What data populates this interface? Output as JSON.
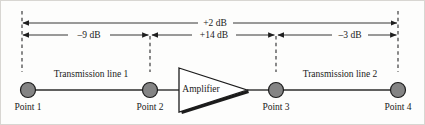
{
  "diagram": {
    "type": "signal-chain-block-diagram",
    "colors": {
      "node_fill": "#848484",
      "stroke": "#1c1c1c",
      "background": "#fdfdfc",
      "frame": "#d8d6d2"
    },
    "overall": {
      "label": "+2 dB",
      "from": "Point 1",
      "to": "Point 4",
      "value_db": 2
    },
    "segments": [
      {
        "id": "seg-1",
        "label": "–9 dB",
        "value_db": -9,
        "from": "Point 1",
        "to": "Point 2",
        "element": "Transmission line 1"
      },
      {
        "id": "seg-2",
        "label": "+14 dB",
        "value_db": 14,
        "from": "Point 2",
        "to": "Point 3",
        "element": "Amplifier"
      },
      {
        "id": "seg-3",
        "label": "–3 dB",
        "value_db": -3,
        "from": "Point 3",
        "to": "Point 4",
        "element": "Transmission line 2"
      }
    ],
    "nodes": [
      {
        "id": "point-1",
        "label": "Point 1",
        "x": 28,
        "y": 90
      },
      {
        "id": "point-2",
        "label": "Point 2",
        "x": 150,
        "y": 90
      },
      {
        "id": "point-3",
        "label": "Point 3",
        "x": 276,
        "y": 90
      },
      {
        "id": "point-4",
        "label": "Point 4",
        "x": 398,
        "y": 90
      }
    ],
    "blocks": [
      {
        "id": "transmission-line-1",
        "label": "Transmission line 1",
        "kind": "line"
      },
      {
        "id": "amplifier",
        "label": "Amplifier",
        "kind": "triangle"
      },
      {
        "id": "transmission-line-2",
        "label": "Transmission line 2",
        "kind": "line"
      }
    ]
  }
}
